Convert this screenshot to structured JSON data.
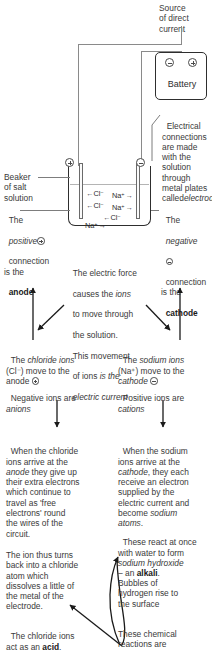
{
  "diagram": {
    "source_label": "Source\nof direct\ncurrent",
    "battery_label": "Battery",
    "battery_terminal_minus": "minus-terminal",
    "battery_terminal_plus": "plus-terminal",
    "beaker_left_terminal": "plus-terminal",
    "beaker_right_terminal": "minus-terminal",
    "ions": [
      {
        "left": "←Cl⁻",
        "right": "Na⁺→"
      },
      {
        "left": "←Cl⁻",
        "right": "Na⁺→"
      }
    ],
    "ion_extra_cl": "←Cl⁻",
    "ion_extra_na": "Na⁺→"
  },
  "callouts": {
    "beaker": "Beaker\nof salt\nsolution",
    "electrical_connections": "Electrical\nconnections\nare made\nwith the\nsolution\nthrough\nmetal plates\ncalled",
    "electrical_connections_italic": "electrodes",
    "anode_1": "The",
    "anode_2_italic": "positive",
    "anode_3": "connection\nis the",
    "anode_bold": "anode",
    "cathode_1": "The",
    "cathode_2_italic": "negative",
    "cathode_3": "connection\nis the",
    "cathode_bold": "cathode"
  },
  "center_text": {
    "line1": "The electric force",
    "line2a": "causes the ",
    "line2b_italic": "ions",
    "line3": "to move through",
    "line4": "the solution.",
    "line5": "This movement",
    "line6a": "of ions ",
    "line6b_italic": "is the",
    "line7_italic": "electric current"
  },
  "left_column": {
    "step1_a": "The ",
    "step1_italic": "chloride ions",
    "step1_b": "(Cl⁻) move to the\nanode ",
    "step2_a": "Negative ions are\n",
    "step2_italic": "anions",
    "step3_a": "When the chloride\nions arrive at the\n",
    "step3_italic": "anode",
    "step3_b": " they give up\ntheir extra electrons\nwhich continue to\ntravel as 'free\nelectrons' round\nthe wires of the\ncircuit.",
    "step4": "The ion thus turns\nback into a chloride\natom which\ndissolves a little of\nthe metal of the\nelectrode.",
    "step5_a": "The chloride ions\nact as an ",
    "step5_bold": "acid",
    "step5_b": "."
  },
  "right_column": {
    "step1_a": "The ",
    "step1_italic": "sodium ions",
    "step1_b": "(Na⁺) move to the\n",
    "step1_italic2": "cathode",
    "step2_a": "Positive ions are\n",
    "step2_italic": "cations",
    "step3_a": "When the sodium\nions arrive at the\n",
    "step3_italic": "cathode",
    "step3_b": ", they each\nreceive an electron\nsupplied by the\nelectric current and\nbecome ",
    "step3_italic2": "sodium\natoms",
    "step3_c": ".",
    "step4_a": "These react at once\nwith water to form\n",
    "step4_italic": "sodium hydroxide",
    "step4_b": "– an ",
    "step4_bold": "alkali",
    "step4_c": ".",
    "step5": "Bubbles of\nhydrogen rise to\nthe surface",
    "step6": "These chemical\nreactions are"
  },
  "colors": {
    "text": "#3a3a3a",
    "bold_text": "#1a1a1a",
    "line": "#7d7d7d",
    "stroke_dark": "#2e2e2e",
    "background": "#ffffff"
  }
}
